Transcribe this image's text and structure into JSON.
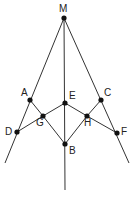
{
  "diagram": {
    "type": "geometry",
    "line_color": "#333333",
    "point_color": "#111111",
    "points": [
      {
        "id": "M",
        "label": "M",
        "x": 64,
        "y": 18,
        "lx": 59,
        "ly": 4
      },
      {
        "id": "A",
        "label": "A",
        "x": 30,
        "y": 100,
        "lx": 21,
        "ly": 88
      },
      {
        "id": "C",
        "label": "C",
        "x": 101,
        "y": 100,
        "lx": 104,
        "ly": 88
      },
      {
        "id": "E",
        "label": "E",
        "x": 65,
        "y": 103,
        "lx": 69,
        "ly": 91
      },
      {
        "id": "G",
        "label": "G",
        "x": 43,
        "y": 116,
        "lx": 36,
        "ly": 118
      },
      {
        "id": "H",
        "label": "H",
        "x": 87,
        "y": 116,
        "lx": 84,
        "ly": 118
      },
      {
        "id": "D",
        "label": "D",
        "x": 17,
        "y": 132,
        "lx": 5,
        "ly": 127
      },
      {
        "id": "F",
        "label": "F",
        "x": 117,
        "y": 133,
        "lx": 121,
        "ly": 127
      },
      {
        "id": "B",
        "label": "B",
        "x": 65,
        "y": 144,
        "lx": 69,
        "ly": 146
      }
    ],
    "segments": [
      [
        "M",
        "LEFT_END"
      ],
      [
        "M",
        "RIGHT_END"
      ],
      [
        "M",
        "CENTER_END"
      ],
      [
        "A",
        "G"
      ],
      [
        "G",
        "B"
      ],
      [
        "C",
        "H"
      ],
      [
        "H",
        "B"
      ],
      [
        "D",
        "G"
      ],
      [
        "G",
        "E"
      ],
      [
        "E",
        "H"
      ],
      [
        "H",
        "F"
      ]
    ],
    "endpoints": {
      "LEFT_END": {
        "x": 5,
        "y": 163
      },
      "RIGHT_END": {
        "x": 129,
        "y": 163
      },
      "CENTER_END": {
        "x": 65,
        "y": 190
      }
    }
  }
}
